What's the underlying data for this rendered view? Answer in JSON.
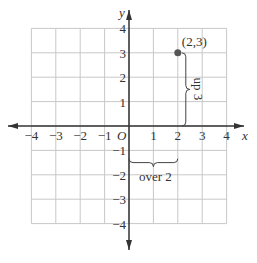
{
  "chart_data": {
    "type": "scatter",
    "title": "",
    "xlabel": "x",
    "ylabel": "y",
    "origin_label": "O",
    "xlim": [
      -4,
      4
    ],
    "ylim": [
      -4,
      4
    ],
    "grid": true,
    "x_ticks": [
      "-4",
      "-3",
      "-2",
      "-1",
      "1",
      "2",
      "3",
      "4"
    ],
    "y_ticks": [
      "4",
      "3",
      "2",
      "1",
      "-1",
      "-2",
      "-3",
      "-4"
    ],
    "points": [
      {
        "x": 2,
        "y": 3,
        "label": "(2,3)"
      }
    ],
    "annotations": [
      {
        "text": "up 3",
        "type": "brace",
        "from": [
          2,
          0
        ],
        "to": [
          2,
          3
        ]
      },
      {
        "text": "over 2",
        "type": "brace",
        "from": [
          0,
          0
        ],
        "to": [
          2,
          0
        ]
      }
    ]
  }
}
